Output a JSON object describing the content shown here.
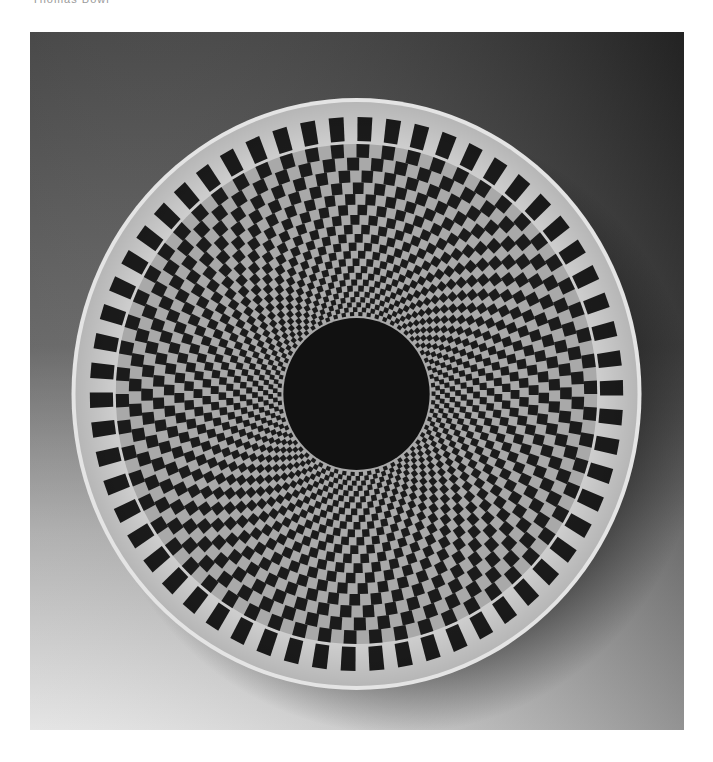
{
  "caption": {
    "text": "Thomas Bowl"
  },
  "photo": {
    "subject": "turned wooden bowl with radial checkerboard inlay, viewed from above",
    "background": {
      "top_left": "#353535",
      "top_right": "#161616",
      "bottom": "#e2e2e2"
    },
    "bowl": {
      "cx": 326.5,
      "cy": 362,
      "rx": 285,
      "ry": 296,
      "rim_color": "#cfcfcf",
      "rim_edge_color": "#e4e4e4",
      "light_cell_color": "#a9a9a9",
      "dark_cell_color": "#1b1b1b",
      "center_disc_radius": 76,
      "center_disc_color": "#111111",
      "cells_per_ring": 116,
      "outer_ring": {
        "r_outer": 277,
        "r_inner": 253,
        "cell_fill_ratio": 0.55
      },
      "inner_rings": {
        "r_start": 250,
        "r_end": 78,
        "shrink": 0.94
      }
    }
  }
}
